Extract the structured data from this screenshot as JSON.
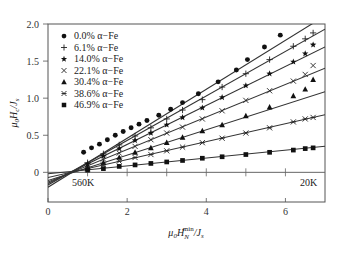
{
  "chart_data": {
    "type": "scatter",
    "title": "",
    "xlabel": "μ0 H_N^min / J_s",
    "ylabel": "μ0 H_c / J_s",
    "xlim": [
      0,
      7.0
    ],
    "ylim": [
      -0.4,
      2.0
    ],
    "xticks": [
      0,
      2,
      4,
      6
    ],
    "yticks": [
      0,
      0.5,
      1.0,
      1.5,
      2.0
    ],
    "ytick_labels": [
      "0",
      "0.5",
      "1.0",
      "1.5",
      "2.0"
    ],
    "grid": false,
    "legend_position": "upper left",
    "annotations": [
      {
        "text": "560K",
        "x": 1.0,
        "y": -0.1
      },
      {
        "text": "20K",
        "x": 6.7,
        "y": -0.1
      }
    ],
    "zero_line_ticks": [
      1,
      2,
      3,
      4,
      5,
      6
    ],
    "series": [
      {
        "name": "0.0% α−Fe",
        "marker": "circle",
        "fit": {
          "intercept": -0.2,
          "slope": 0.33
        },
        "x": [
          0.9,
          1.1,
          1.3,
          1.5,
          1.7,
          1.9,
          2.1,
          2.3,
          2.5,
          2.8,
          3.1,
          3.4,
          3.8,
          4.3,
          4.76,
          5.04,
          5.47,
          5.87
        ],
        "y": [
          0.27,
          0.33,
          0.38,
          0.44,
          0.5,
          0.55,
          0.6,
          0.65,
          0.7,
          0.77,
          0.85,
          0.94,
          1.06,
          1.22,
          1.38,
          1.52,
          1.69,
          1.85
        ]
      },
      {
        "name": "6.1% α−Fe",
        "marker": "plus",
        "fit": {
          "intercept": -0.17,
          "slope": 0.3
        },
        "x": [
          1.0,
          1.4,
          1.8,
          2.2,
          2.6,
          3.0,
          3.4,
          3.9,
          4.4,
          5.0,
          5.6,
          6.2,
          6.5,
          6.7
        ],
        "y": [
          0.13,
          0.25,
          0.37,
          0.49,
          0.6,
          0.72,
          0.84,
          0.98,
          1.15,
          1.33,
          1.52,
          1.7,
          1.8,
          1.88
        ]
      },
      {
        "name": "14.0% α−Fe",
        "marker": "star",
        "fit": {
          "intercept": -0.15,
          "slope": 0.263
        },
        "x": [
          1.0,
          1.4,
          1.8,
          2.2,
          2.6,
          3.0,
          3.4,
          3.9,
          4.4,
          5.0,
          5.6,
          6.2,
          6.5,
          6.7
        ],
        "y": [
          0.11,
          0.22,
          0.32,
          0.43,
          0.53,
          0.64,
          0.74,
          0.87,
          1.01,
          1.17,
          1.33,
          1.49,
          1.6,
          1.72
        ]
      },
      {
        "name": "22.1% α−Fe",
        "marker": "x",
        "fit": {
          "intercept": -0.13,
          "slope": 0.219
        },
        "x": [
          1.0,
          1.4,
          1.8,
          2.2,
          2.6,
          3.0,
          3.4,
          3.9,
          4.4,
          5.0,
          5.6,
          6.2,
          6.5,
          6.7
        ],
        "y": [
          0.09,
          0.18,
          0.26,
          0.35,
          0.44,
          0.53,
          0.61,
          0.72,
          0.83,
          0.97,
          1.1,
          1.23,
          1.32,
          1.44
        ]
      },
      {
        "name": "30.4% α−Fe",
        "marker": "triangle",
        "fit": {
          "intercept": -0.11,
          "slope": 0.171
        },
        "x": [
          1.0,
          1.4,
          1.8,
          2.2,
          2.6,
          3.0,
          3.4,
          3.9,
          4.4,
          5.0,
          5.6,
          6.2,
          6.5,
          6.7
        ],
        "y": [
          0.06,
          0.13,
          0.2,
          0.27,
          0.33,
          0.4,
          0.47,
          0.56,
          0.64,
          0.76,
          0.88,
          1.03,
          1.12,
          1.25
        ]
      },
      {
        "name": "38.6% α−Fe",
        "marker": "asterisk",
        "fit": {
          "intercept": -0.07,
          "slope": 0.121
        },
        "x": [
          1.0,
          1.4,
          1.8,
          2.2,
          2.6,
          3.0,
          3.4,
          3.9,
          4.4,
          5.0,
          5.6,
          6.2,
          6.5,
          6.7
        ],
        "y": [
          0.05,
          0.1,
          0.15,
          0.2,
          0.24,
          0.29,
          0.34,
          0.4,
          0.46,
          0.53,
          0.6,
          0.68,
          0.72,
          0.74
        ]
      },
      {
        "name": "46.9% α−Fe",
        "marker": "square",
        "fit": {
          "intercept": -0.02,
          "slope": 0.053
        },
        "x": [
          1.0,
          1.4,
          1.8,
          2.2,
          2.6,
          3.0,
          3.4,
          3.9,
          4.4,
          5.0,
          5.6,
          6.2,
          6.5,
          6.7
        ],
        "y": [
          0.03,
          0.05,
          0.08,
          0.1,
          0.12,
          0.14,
          0.16,
          0.19,
          0.21,
          0.24,
          0.27,
          0.3,
          0.32,
          0.33
        ]
      }
    ]
  }
}
